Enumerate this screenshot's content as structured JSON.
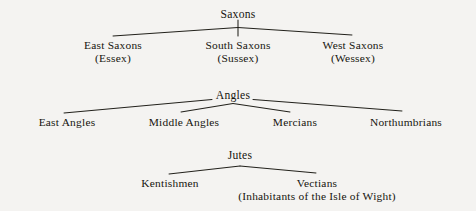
{
  "diagram": {
    "background_color": "#f4f3f1",
    "line_color": "#22211b",
    "text_color": "#16150f",
    "groups": [
      {
        "id": "saxons",
        "root": {
          "label": "Saxons"
        },
        "children": [
          {
            "label": "East Saxons",
            "sublabel": "(Essex)"
          },
          {
            "label": "South Saxons",
            "sublabel": "(Sussex)"
          },
          {
            "label": "West Saxons",
            "sublabel": "(Wessex)"
          }
        ]
      },
      {
        "id": "angles",
        "root": {
          "label": "Angles"
        },
        "children": [
          {
            "label": "East Angles",
            "sublabel": ""
          },
          {
            "label": "Middle Angles",
            "sublabel": ""
          },
          {
            "label": "Mercians",
            "sublabel": ""
          },
          {
            "label": "Northumbrians",
            "sublabel": ""
          }
        ]
      },
      {
        "id": "jutes",
        "root": {
          "label": "Jutes"
        },
        "children": [
          {
            "label": "Kentishmen",
            "sublabel": ""
          },
          {
            "label": "Vectians",
            "sublabel": "(Inhabitants of the Isle of Wight)"
          }
        ]
      }
    ]
  }
}
